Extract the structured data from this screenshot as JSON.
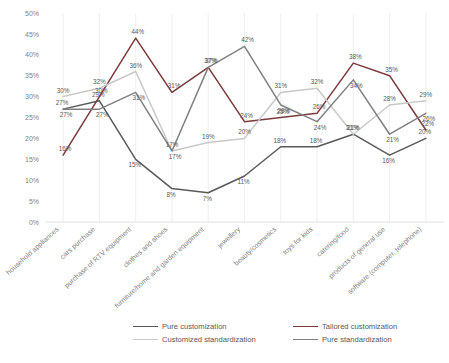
{
  "chart_data": {
    "type": "line",
    "title": "",
    "xlabel": "",
    "ylabel": "",
    "ylim": [
      0,
      50
    ],
    "ytick_labels": [
      "0%",
      "5%",
      "10%",
      "15%",
      "20%",
      "25%",
      "30%",
      "35%",
      "40%",
      "45%",
      "50%"
    ],
    "ytick_values": [
      0,
      5,
      10,
      15,
      20,
      25,
      30,
      35,
      40,
      45,
      50
    ],
    "grid": "vertical-only",
    "legend_position": "bottom",
    "value_suffix": "%",
    "categories": [
      "household appliances",
      "cars purchase",
      "purchase of RTV equipment",
      "clothes and shoes",
      "furniture/home and garden equipment",
      "jewellery",
      "beauty/cosmetics",
      "toys for kids",
      "catering/food",
      "products of general use",
      "software (computer, telephone)"
    ],
    "series": [
      {
        "name": "Pure customization",
        "color": "#595959",
        "values": [
          27,
          29,
          15,
          8,
          7,
          11,
          18,
          18,
          21,
          16,
          20
        ]
      },
      {
        "name": "Tailored customization",
        "color": "#7b3a3a",
        "values": [
          16,
          30,
          44,
          31,
          37,
          24,
          25,
          26,
          38,
          35,
          22
        ]
      },
      {
        "name": "Customized standardization",
        "color": "#c9c9c9",
        "values": [
          30,
          32,
          36,
          17,
          19,
          20,
          31,
          32,
          21,
          28,
          29
        ]
      },
      {
        "name": "Pure standardization",
        "color": "#808080",
        "values": [
          27,
          27,
          31,
          17,
          37,
          42,
          28,
          24,
          34,
          21,
          26
        ]
      }
    ]
  },
  "legend": {
    "items": [
      "Pure customization",
      "Tailored customization",
      "Customized standardization",
      "Pure standardization"
    ]
  },
  "caption": {
    "text": ""
  }
}
